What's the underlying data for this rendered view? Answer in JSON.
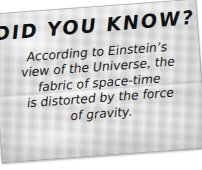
{
  "card": {
    "title": "DID YOU KNOW?",
    "body_lines": [
      "According to Einstein’s",
      "view of the Universe, the",
      "fabric of space-time",
      "is distorted by the force",
      "of gravity."
    ],
    "body_text": "According to Einstein’s view of the Universe, the fabric of space-time is distorted by the force of gravity.",
    "colors": {
      "paper": "#d9d9d9",
      "text": "#111111",
      "page_background": "#ffffff",
      "edge": "#8c8c8c"
    },
    "rotation_degrees": -4.2
  }
}
